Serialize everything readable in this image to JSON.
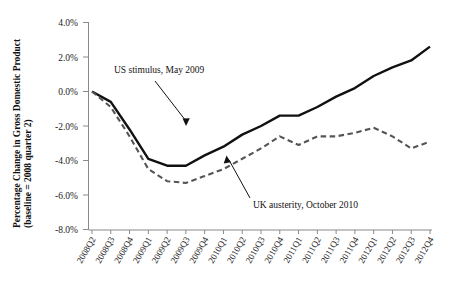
{
  "chart_data": {
    "type": "line",
    "title": "",
    "xlabel": "",
    "ylabel": "Percentage Change in Gross Domestic Product",
    "ylabel_line2": "(baseline = 2008 quarter 2)",
    "ylim": [
      -8.0,
      4.0
    ],
    "ytick_labels": [
      "4.0%",
      "2.0%",
      "0.0%",
      "-2.0%",
      "-4.0%",
      "-6.0%",
      "-8.0%"
    ],
    "ytick_values": [
      4.0,
      2.0,
      0.0,
      -2.0,
      -4.0,
      -6.0,
      -8.0
    ],
    "grid": false,
    "legend": "none",
    "categories": [
      "2008Q2",
      "2008Q3",
      "2008Q4",
      "2009Q1",
      "2009Q2",
      "2009Q3",
      "2009Q4",
      "2010Q1",
      "2010Q2",
      "2010Q3",
      "2010Q4",
      "2011Q1",
      "2011Q2",
      "2011Q3",
      "2011Q4",
      "2012Q1",
      "2012Q2",
      "2012Q3",
      "2012Q4"
    ],
    "series": [
      {
        "name": "United States",
        "style": "solid",
        "color": "#111111",
        "values": [
          0.0,
          -0.6,
          -2.2,
          -3.9,
          -4.3,
          -4.3,
          -3.7,
          -3.2,
          -2.5,
          -2.0,
          -1.4,
          -1.4,
          -0.9,
          -0.3,
          0.2,
          0.9,
          1.4,
          1.8,
          2.6
        ]
      },
      {
        "name": "United Kingdom",
        "style": "dashed",
        "color": "#555555",
        "values": [
          0.0,
          -0.9,
          -2.6,
          -4.5,
          -5.2,
          -5.3,
          -4.9,
          -4.5,
          -3.9,
          -3.3,
          -2.6,
          -3.1,
          -2.6,
          -2.6,
          -2.4,
          -2.1,
          -2.6,
          -3.3,
          -2.9
        ]
      }
    ],
    "annotations": [
      {
        "id": "us-stimulus",
        "text": "US stimulus, May 2009",
        "points_to": "2009Q2"
      },
      {
        "id": "uk-austerity",
        "text": "UK austerity, October 2010",
        "points_to": "2010Q4"
      }
    ]
  }
}
